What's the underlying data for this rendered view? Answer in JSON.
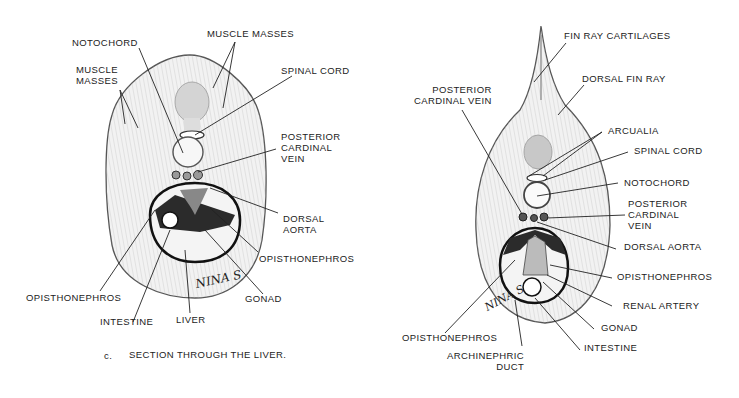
{
  "left_figure": {
    "caption_letter": "c.",
    "caption": "SECTION THROUGH THE LIVER.",
    "signature": "NINA S",
    "labels": {
      "notochord": "NOTOCHORD",
      "muscle_masses_top": "MUSCLE MASSES",
      "muscle_masses_left": "MUSCLE\nMASSES",
      "spinal_cord": "SPINAL CORD",
      "posterior_cardinal_vein": "POSTERIOR\nCARDINAL\nVEIN",
      "dorsal_aorta": "DORSAL\nAORTA",
      "opisthonephros_right": "OPISTHONEPHROS",
      "opisthonephros_left": "OPISTHONEPHROS",
      "gonad": "GONAD",
      "intestine": "INTESTINE",
      "liver": "LIVER"
    }
  },
  "right_figure": {
    "signature": "NINA S",
    "labels": {
      "fin_ray_cartilages": "FIN RAY CARTILAGES",
      "dorsal_fin_ray": "DORSAL FIN RAY",
      "posterior_cardinal_vein_left": "POSTERIOR\nCARDINAL VEIN",
      "arcualia": "ARCUALIA",
      "spinal_cord": "SPINAL CORD",
      "notochord": "NOTOCHORD",
      "posterior_cardinal_vein_right": "POSTERIOR\nCARDINAL\nVEIN",
      "dorsal_aorta": "DORSAL AORTA",
      "opisthonephros_right": "OPISTHONEPHROS",
      "renal_artery": "RENAL ARTERY",
      "gonad": "GONAD",
      "intestine": "INTESTINE",
      "opisthonephros_left": "OPISTHONEPHROS",
      "archinephric_duct": "ARCHINEPHRIC\nDUCT"
    }
  }
}
